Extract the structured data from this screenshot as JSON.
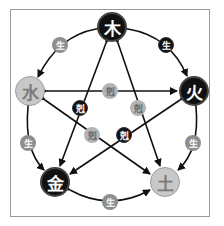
{
  "colors": {
    "dark": "#111111",
    "light": "#c8c8c8",
    "badge_gray": "#8e8e8e",
    "badge_light": "#b4b4b4",
    "line": "#111111",
    "frame": "#9a9a9a"
  },
  "elements": [
    {
      "id": "wood",
      "label": "木",
      "x": 112,
      "y": 27,
      "style": "dark"
    },
    {
      "id": "fire",
      "label": "火",
      "x": 194,
      "y": 91,
      "style": "dark"
    },
    {
      "id": "earth",
      "label": "土",
      "x": 165,
      "y": 182,
      "style": "light"
    },
    {
      "id": "metal",
      "label": "金",
      "x": 55,
      "y": 182,
      "style": "dark"
    },
    {
      "id": "water",
      "label": "水",
      "x": 30,
      "y": 91,
      "style": "light"
    }
  ],
  "generate_badges": [
    {
      "label": "生",
      "x": 60,
      "y": 45,
      "style": "gray"
    },
    {
      "label": "生",
      "x": 166,
      "y": 45,
      "style": "dark"
    },
    {
      "label": "生",
      "x": 28,
      "y": 143,
      "style": "gray"
    },
    {
      "label": "生",
      "x": 193,
      "y": 143,
      "style": "gray"
    },
    {
      "label": "生",
      "x": 110,
      "y": 202,
      "style": "gray"
    }
  ],
  "overcome_badges": [
    {
      "label": "剋",
      "x": 110,
      "y": 91,
      "style": "lightgray"
    },
    {
      "label": "剋",
      "x": 80,
      "y": 108,
      "style": "dark"
    },
    {
      "label": "剋",
      "x": 138,
      "y": 108,
      "style": "lightgray"
    },
    {
      "label": "剋",
      "x": 92,
      "y": 135,
      "style": "lightgray"
    },
    {
      "label": "剋",
      "x": 124,
      "y": 135,
      "style": "dark"
    }
  ]
}
